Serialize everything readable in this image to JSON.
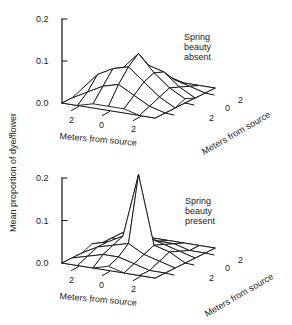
{
  "figure": {
    "y_axis_label": "Mean proportion of dye/flower",
    "panels": [
      {
        "annotation": [
          "Spring",
          "beauty",
          "absent"
        ],
        "z_ticks": [
          "0.2",
          "0.1",
          "0.0"
        ],
        "x_label": "Meters from source",
        "y_label": "Meters from source",
        "x_ticks": [
          "2",
          "0",
          "2"
        ],
        "y_ticks": [
          "2",
          "0",
          "2"
        ]
      },
      {
        "annotation": [
          "Spring",
          "beauty",
          "present"
        ],
        "z_ticks": [
          "0.2",
          "0.1",
          "0.0"
        ],
        "x_label": "Meters from source",
        "y_label": "Meters from source",
        "x_ticks": [
          "2",
          "0",
          "2"
        ],
        "y_ticks": [
          "2",
          "0",
          "2"
        ]
      }
    ]
  },
  "chart_data": [
    {
      "type": "surface3d",
      "title": "Spring beauty absent",
      "xlabel": "Meters from source",
      "ylabel": "Meters from source",
      "zlabel": "Mean proportion of dye/flower",
      "x_ticks": [
        -2,
        0,
        2
      ],
      "y_ticks": [
        -2,
        0,
        2
      ],
      "zlim": [
        0.0,
        0.2
      ],
      "z_ticks": [
        0.0,
        0.1,
        0.2
      ],
      "grid_x": [
        -3,
        -2,
        -1,
        0,
        1,
        2,
        3
      ],
      "grid_y": [
        -3,
        -2,
        -1,
        0,
        1,
        2,
        3
      ],
      "z": [
        [
          0.0,
          0.0,
          0.01,
          0.01,
          0.01,
          0.0,
          0.0
        ],
        [
          0.0,
          0.02,
          0.04,
          0.05,
          0.03,
          0.01,
          0.0
        ],
        [
          0.01,
          0.05,
          0.07,
          0.08,
          0.05,
          0.02,
          0.0
        ],
        [
          0.01,
          0.04,
          0.06,
          0.1,
          0.06,
          0.03,
          0.01
        ],
        [
          0.0,
          0.02,
          0.04,
          0.06,
          0.05,
          0.02,
          0.0
        ],
        [
          0.0,
          0.01,
          0.02,
          0.03,
          0.02,
          0.01,
          0.0
        ],
        [
          0.0,
          0.0,
          0.0,
          0.01,
          0.0,
          0.0,
          0.0
        ]
      ],
      "peak_value": 0.1
    },
    {
      "type": "surface3d",
      "title": "Spring beauty present",
      "xlabel": "Meters from source",
      "ylabel": "Meters from source",
      "zlabel": "Mean proportion of dye/flower",
      "x_ticks": [
        -2,
        0,
        2
      ],
      "y_ticks": [
        -2,
        0,
        2
      ],
      "zlim": [
        0.0,
        0.2
      ],
      "z_ticks": [
        0.0,
        0.1,
        0.2
      ],
      "grid_x": [
        -3,
        -2,
        -1,
        0,
        1,
        2,
        3
      ],
      "grid_y": [
        -3,
        -2,
        -1,
        0,
        1,
        2,
        3
      ],
      "z": [
        [
          0.0,
          0.0,
          0.0,
          0.01,
          0.0,
          0.0,
          0.0
        ],
        [
          0.0,
          0.01,
          0.02,
          0.02,
          0.01,
          0.0,
          0.0
        ],
        [
          0.0,
          0.02,
          0.03,
          0.04,
          0.02,
          0.01,
          0.0
        ],
        [
          0.01,
          0.02,
          0.04,
          0.19,
          0.03,
          0.02,
          0.0
        ],
        [
          0.0,
          0.01,
          0.02,
          0.03,
          0.02,
          0.01,
          0.0
        ],
        [
          0.0,
          0.0,
          0.01,
          0.01,
          0.01,
          0.0,
          0.0
        ],
        [
          0.0,
          0.0,
          0.0,
          0.0,
          0.0,
          0.0,
          0.0
        ]
      ],
      "peak_value": 0.19
    }
  ]
}
